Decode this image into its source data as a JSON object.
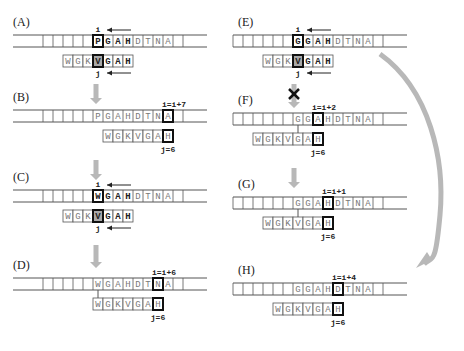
{
  "figure": {
    "colors": {
      "line": "#555555",
      "highlight_border": "#111111",
      "highlight_fill": "#a8a8a8",
      "arrow": "#b8b8b8",
      "text_dim": "#777777",
      "text_bold": "#222222"
    },
    "pattern": [
      "W",
      "G",
      "K",
      "V",
      "G",
      "A",
      "H"
    ],
    "panels": [
      {
        "id": "A",
        "label": "(A)",
        "x0": 13,
        "y": 35,
        "strip_start": 43,
        "strip_end": 207,
        "text": [
          "P",
          "G",
          "A",
          "H",
          "D",
          "T",
          "N",
          "A"
        ],
        "text_start_cell": 5,
        "text_bold_count": 4,
        "text_highlight": 0,
        "pattern_offset": 2,
        "pattern_bold_from": 3,
        "pattern_highlight": 3,
        "pattern_highlight_fill": true,
        "top_label": "i",
        "top_arrow": true,
        "bottom_label": "j",
        "bottom_arrow": true,
        "connector": false
      },
      {
        "id": "B",
        "label": "(B)",
        "x0": 13,
        "y": 110,
        "strip_start": 43,
        "strip_end": 207,
        "text": [
          "P",
          "G",
          "A",
          "H",
          "D",
          "T",
          "N",
          "A"
        ],
        "text_start_cell": 5,
        "text_bold_count": 0,
        "text_highlight": 7,
        "pattern_offset": 9,
        "pattern_bold_from": 99,
        "pattern_highlight": 6,
        "pattern_highlight_fill": false,
        "top_label": "i=i+7",
        "top_arrow": false,
        "bottom_label": "j=6",
        "bottom_arrow": false,
        "connector": false
      },
      {
        "id": "C",
        "label": "(C)",
        "x0": 13,
        "y": 190,
        "strip_start": 43,
        "strip_end": 207,
        "text": [
          "W",
          "G",
          "A",
          "H",
          "D",
          "T",
          "N",
          "A"
        ],
        "text_start_cell": 5,
        "text_bold_count": 4,
        "text_highlight": 0,
        "pattern_offset": 2,
        "pattern_bold_from": 3,
        "pattern_highlight": 3,
        "pattern_highlight_fill": true,
        "top_label": "i",
        "top_arrow": true,
        "bottom_label": "j",
        "bottom_arrow": true,
        "connector": false
      },
      {
        "id": "D",
        "label": "(D)",
        "x0": 13,
        "y": 278,
        "strip_start": 43,
        "strip_end": 207,
        "text": [
          "W",
          "G",
          "A",
          "H",
          "D",
          "T",
          "N",
          "A"
        ],
        "text_start_cell": 5,
        "text_bold_count": 0,
        "text_highlight": 6,
        "pattern_offset": 5,
        "pattern_bold_from": 99,
        "pattern_highlight": 6,
        "pattern_highlight_fill": false,
        "top_label": "i=i+6",
        "top_arrow": false,
        "bottom_label": "j=6",
        "bottom_arrow": false,
        "connector": true
      },
      {
        "id": "E",
        "label": "(E)",
        "x0": 238,
        "y": 35,
        "strip_start": 233,
        "strip_end": 407,
        "text": [
          "G",
          "G",
          "A",
          "H",
          "D",
          "T",
          "N",
          "A"
        ],
        "text_start_cell": 6,
        "text_bold_count": 4,
        "text_highlight": 0,
        "pattern_offset": 3,
        "pattern_bold_from": 3,
        "pattern_highlight": 3,
        "pattern_highlight_fill": true,
        "top_label": "i",
        "top_arrow": true,
        "bottom_label": "j",
        "bottom_arrow": true,
        "connector": false
      },
      {
        "id": "F",
        "label": "(F)",
        "x0": 238,
        "y": 113,
        "strip_start": 233,
        "strip_end": 407,
        "text": [
          "G",
          "G",
          "A",
          "H",
          "D",
          "T",
          "N",
          "A"
        ],
        "text_start_cell": 6,
        "text_bold_count": 0,
        "text_highlight": 2,
        "pattern_offset": 2,
        "pattern_bold_from": 99,
        "pattern_highlight": 6,
        "pattern_highlight_fill": false,
        "top_label": "i=i+2",
        "top_arrow": false,
        "bottom_label": "j=6",
        "bottom_arrow": false,
        "connector": true
      },
      {
        "id": "G",
        "label": "(G)",
        "x0": 238,
        "y": 197,
        "strip_start": 233,
        "strip_end": 407,
        "text": [
          "G",
          "G",
          "A",
          "H",
          "D",
          "T",
          "N",
          "A"
        ],
        "text_start_cell": 6,
        "text_bold_count": 0,
        "text_highlight": 3,
        "pattern_offset": 3,
        "pattern_bold_from": 99,
        "pattern_highlight": 6,
        "pattern_highlight_fill": false,
        "top_label": "i=i+1",
        "top_arrow": false,
        "bottom_label": "j=6",
        "bottom_arrow": false,
        "connector": true
      },
      {
        "id": "H",
        "label": "(H)",
        "x0": 238,
        "y": 283,
        "strip_start": 233,
        "strip_end": 407,
        "text": [
          "G",
          "G",
          "A",
          "H",
          "D",
          "T",
          "N",
          "A"
        ],
        "text_start_cell": 6,
        "text_bold_count": 0,
        "text_highlight": 4,
        "pattern_offset": 4,
        "pattern_bold_from": 99,
        "pattern_highlight": 6,
        "pattern_highlight_fill": false,
        "top_label": "i=i+4",
        "top_arrow": false,
        "bottom_label": "j=6",
        "bottom_arrow": false,
        "connector": false
      }
    ],
    "down_arrows": [
      {
        "id": "A-to-B",
        "x": 96,
        "y1": 84,
        "y2": 104
      },
      {
        "id": "B-to-C",
        "x": 96,
        "y1": 160,
        "y2": 180
      },
      {
        "id": "C-to-D",
        "x": 96,
        "y1": 245,
        "y2": 268
      },
      {
        "id": "F-to-G",
        "x": 294,
        "y1": 168,
        "y2": 188
      }
    ],
    "blocked_arrow": {
      "id": "E-to-F",
      "x": 294,
      "y1": 84,
      "y2": 108,
      "mark": "✕"
    },
    "curved_arrow": {
      "id": "E-to-H",
      "from": [
        380,
        54
      ],
      "to": [
        424,
        268
      ]
    }
  }
}
